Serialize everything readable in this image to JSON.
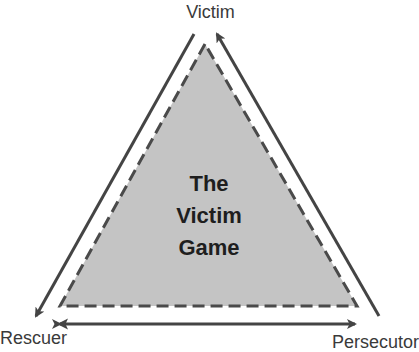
{
  "diagram": {
    "title_lines": [
      "The",
      "Victim",
      "Game"
    ],
    "nodes": {
      "top": "Victim",
      "bottom_left": "Rescuer",
      "bottom_right": "Persecutor"
    },
    "edges": [
      {
        "from": "Persecutor",
        "to": "Victim",
        "style": "solid-arrow"
      },
      {
        "from": "Victim",
        "to": "Rescuer",
        "style": "solid-arrow"
      },
      {
        "from": "Rescuer",
        "to": "Persecutor",
        "style": "solid-double-arrow"
      }
    ],
    "inner_triangle": {
      "fill": "#c4c4c4",
      "border": "dashed",
      "border_color": "#4a4a4a"
    },
    "colors": {
      "arrow": "#444444",
      "text": "#3a3a3a",
      "title_text": "#1e1e1e"
    }
  }
}
